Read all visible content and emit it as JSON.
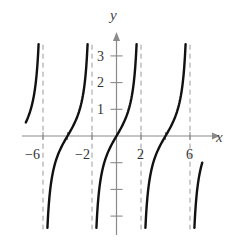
{
  "chart_data": {
    "type": "line",
    "title": "",
    "function": "y = tan(pi*x/4)",
    "xlabel": "x",
    "ylabel": "y",
    "xlim": [
      -7.4,
      7.0
    ],
    "ylim": [
      -3.5,
      3.4
    ],
    "grid": false,
    "legend": null,
    "x_ticks": [
      -6,
      -4,
      -2,
      2,
      4,
      6
    ],
    "x_tick_labels": [
      "-6",
      "-2",
      "2",
      "6"
    ],
    "x_tick_label_values": [
      -6,
      -2,
      2,
      6
    ],
    "y_ticks": [
      -3,
      -2,
      -1,
      1,
      2,
      3
    ],
    "y_tick_labels": [
      "1",
      "2",
      "3"
    ],
    "y_tick_label_values": [
      1,
      2,
      3
    ],
    "asymptotes": [
      -6,
      -2,
      2,
      6
    ],
    "asymptote_style": "dashed",
    "series": [
      {
        "name": "branch-1",
        "x": [
          -7.4,
          -7.0,
          -6.6,
          -6.36
        ],
        "values": [
          0.51,
          1.0,
          1.96,
          3.4
        ]
      },
      {
        "name": "branch-2",
        "x": [
          -5.64,
          -5.0,
          -4.0,
          -3.0,
          -2.36
        ],
        "values": [
          -3.4,
          -1.0,
          0.0,
          1.0,
          3.4
        ]
      },
      {
        "name": "branch-3",
        "x": [
          -1.64,
          -1.0,
          0.0,
          1.0,
          1.64
        ],
        "values": [
          -3.4,
          -1.0,
          0.0,
          1.0,
          3.4
        ]
      },
      {
        "name": "branch-4",
        "x": [
          2.36,
          3.0,
          4.0,
          5.0,
          5.64
        ],
        "values": [
          -3.4,
          -1.0,
          0.0,
          1.0,
          3.4
        ]
      },
      {
        "name": "branch-5",
        "x": [
          6.36,
          6.6,
          7.0
        ],
        "values": [
          -3.4,
          -1.96,
          -1.0
        ]
      }
    ]
  },
  "labels": {
    "x_axis": "x",
    "y_axis": "y",
    "xt": [
      "−6",
      "−2",
      "2",
      "6"
    ],
    "yt": [
      "1",
      "2",
      "3"
    ]
  },
  "layout": {
    "origin_px": [
      116.5,
      136
    ],
    "x_scale_px": 12.25,
    "y_scale_px": 26.7,
    "curve_color": "#111111",
    "axis_color": "#8a8a8a",
    "asymptote_color": "#9a9a9a"
  }
}
